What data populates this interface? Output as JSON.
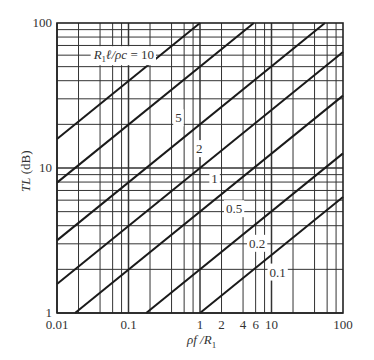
{
  "chart_data": {
    "type": "line",
    "title": "",
    "xlabel": "ρf / R₁",
    "ylabel": "TL (dB)",
    "xscale": "log",
    "yscale": "log",
    "xlim": [
      0.01,
      100
    ],
    "ylim": [
      1,
      100
    ],
    "grid": true,
    "x_tick_labels": [
      "0.01",
      "0.1",
      "1",
      "2",
      "4",
      "6",
      "10",
      "100"
    ],
    "x_tick_values": [
      0.01,
      0.1,
      1,
      2,
      4,
      6,
      10,
      100
    ],
    "y_tick_labels": [
      "1",
      "10",
      "100"
    ],
    "y_tick_values": [
      1,
      10,
      100
    ],
    "x_minor_grid_per_decade": [
      1,
      2,
      4,
      6,
      8
    ],
    "y_minor_grid_per_decade": [
      1,
      2,
      3,
      4,
      5,
      6,
      7,
      8,
      9
    ],
    "parameter_name": "R₁ℓ/ρc",
    "series": [
      {
        "name": "R₁ℓ/ρc = 10",
        "param": 10,
        "label": "R₁ℓ/ρc = 10",
        "label_pos": [
          0.086,
          60
        ],
        "x": [
          0.01,
          0.19
        ],
        "values": [
          16,
          52
        ]
      },
      {
        "name": "5",
        "param": 5,
        "label": "5",
        "label_pos": [
          0.5,
          22
        ],
        "x": [
          0.01,
          1.2
        ],
        "values": [
          8,
          54
        ]
      },
      {
        "name": "2",
        "param": 2,
        "label": "2",
        "label_pos": [
          0.98,
          13.5
        ],
        "x": [
          0.01,
          10.7
        ],
        "values": [
          3.2,
          51
        ]
      },
      {
        "name": "1",
        "param": 1,
        "label": "1",
        "label_pos": [
          1.6,
          8.4
        ],
        "x": [
          0.01,
          100
        ],
        "values": [
          1.6,
          63
        ]
      },
      {
        "name": "0.5",
        "param": 0.5,
        "label": "0.5",
        "label_pos": [
          3.0,
          5.2
        ],
        "x": [
          0.019,
          100
        ],
        "values": [
          1,
          32
        ]
      },
      {
        "name": "0.2",
        "param": 0.2,
        "label": "0.2",
        "label_pos": [
          6.3,
          3.0
        ],
        "x": [
          0.18,
          100
        ],
        "values": [
          1,
          13
        ]
      },
      {
        "name": "0.1",
        "param": 0.1,
        "label": "0.1",
        "label_pos": [
          12.2,
          1.9
        ],
        "x": [
          1,
          100
        ],
        "values": [
          1,
          6.3
        ]
      }
    ],
    "model": "TL ≈ 10 · (R₁ℓ/ρc) · (ρf/R₁)^0.4"
  },
  "axes": {
    "xlabel_parts": {
      "pre": "ρf /R",
      "sub": "1"
    },
    "ylabel_parts": {
      "italic": "TL",
      "rest": " (dB)"
    },
    "legend_title_parts": {
      "a": "R",
      "sub": "1",
      "b": "ℓ/ρc = 10"
    }
  }
}
